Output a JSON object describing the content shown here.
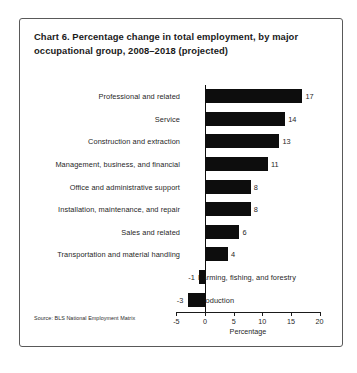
{
  "chart_data": {
    "type": "bar",
    "orientation": "horizontal",
    "title": "Chart 6. Percentage change in total employment, by major occupational group, 2008–2018 (projected)",
    "xlabel": "Percentage",
    "ylabel": "",
    "xlim": [
      -5,
      20
    ],
    "xticks": [
      -5,
      0,
      5,
      10,
      15,
      20
    ],
    "xtick_labels": [
      "-5",
      "0",
      "5",
      "10",
      "15",
      "20"
    ],
    "grid": false,
    "legend": false,
    "bar_color": "#0d0d0d",
    "source": "Source: BLS National Employment Matrix",
    "categories": [
      "Professional and related",
      "Service",
      "Construction and extraction",
      "Management, business, and financial",
      "Office and administrative support",
      "Installation, maintenance, and repair",
      "Sales and related",
      "Transportation and material handling",
      "Farming, fishing, and forestry",
      "Production"
    ],
    "values": [
      17,
      14,
      13,
      11,
      8,
      8,
      6,
      4,
      -1,
      -3
    ],
    "value_labels": [
      "17",
      "14",
      "13",
      "11",
      "8",
      "8",
      "6",
      "4",
      "-1",
      "-3"
    ]
  }
}
